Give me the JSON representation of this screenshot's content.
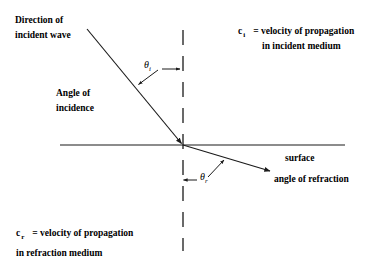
{
  "figure": {
    "type": "optics-refraction-diagram",
    "background_color": "#ffffff",
    "line_color": "#1a1a1a",
    "text_color": "#000000"
  },
  "labels": {
    "direction_line1": "Direction of",
    "direction_line2": "incident wave",
    "angle_line1": "Angle of",
    "angle_line2": "incidence",
    "theta_incident_symbol": "θ",
    "theta_incident_sub": "i",
    "theta_refraction_symbol": "θ",
    "theta_refraction_sub": "r",
    "surface": "surface",
    "angle_of_refraction": "angle of refraction",
    "c_incident_var": "c",
    "c_incident_sub": "i",
    "c_incident_def_line1": "= velocity of propagation",
    "c_incident_def_line2": "in incident medium",
    "c_refraction_var": "c",
    "c_refraction_sub": "r",
    "c_refraction_def_line1": "= velocity of propagation",
    "c_refraction_def_line2": "in refraction medium"
  },
  "geometry": {
    "surface_line": {
      "x1": 60,
      "y1": 145,
      "x2": 345,
      "y2": 145
    },
    "normal_dashed_line": {
      "x": 183,
      "y1": 30,
      "y2": 251,
      "dash": "15 11"
    },
    "incident_ray": {
      "x1": 87,
      "y1": 29,
      "x2": 183,
      "y2": 145
    },
    "refracted_ray": {
      "x1": 183,
      "y1": 145,
      "x2": 272,
      "y2": 172
    },
    "intersection_point": {
      "x": 183,
      "y": 145
    },
    "theta_i_pointer_to_ray": {
      "x1": 160,
      "y1": 70,
      "x2": 137,
      "y2": 86
    },
    "theta_i_pointer_to_normal": {
      "x1": 160,
      "y1": 69,
      "x2": 181,
      "y2": 69
    },
    "theta_r_pointer_to_normal": {
      "x1": 196,
      "y1": 180,
      "x2": 182,
      "y2": 180
    },
    "theta_r_pointer_to_ray": {
      "x1": 208,
      "y1": 177,
      "x2": 224,
      "y2": 161
    }
  }
}
